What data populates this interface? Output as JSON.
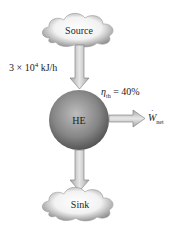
{
  "diagram": {
    "type": "heat-engine",
    "source": {
      "label": "Source"
    },
    "sink": {
      "label": "Sink"
    },
    "engine": {
      "label": "HE"
    },
    "heat_input": {
      "mantissa": "3 × 10",
      "exponent": "4",
      "unit": " kJ/h"
    },
    "efficiency": {
      "symbol": "η",
      "subscript": "th",
      "value": " = 40%"
    },
    "work_output": {
      "symbol": "W",
      "subscript": "net"
    }
  },
  "colors": {
    "arrow_fill": "#c8c8c8",
    "arrow_stroke": "#777777",
    "sphere_light": "#b5b5b5",
    "sphere_dark": "#4a4a4a",
    "cloud_light": "#ffffff",
    "cloud_dark": "#8a8a8a"
  }
}
